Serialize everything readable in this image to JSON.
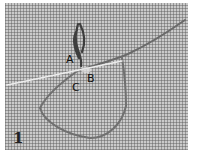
{
  "figure": {
    "step_number": "1",
    "labels": {
      "a": "A",
      "b": "B",
      "c": "C"
    },
    "colors": {
      "fabric": "#b9b9b9",
      "thread": "#5a5a5a",
      "needle": "#e8e8e8"
    }
  }
}
